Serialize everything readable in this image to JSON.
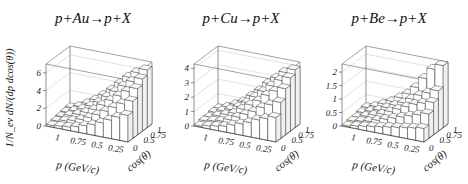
{
  "figure": {
    "y_axis_label": "1/N_ev dN/(dp dcos(θ))"
  },
  "panels": [
    {
      "title": "p+Au→p+X",
      "zticks": [
        "0",
        "2",
        "4",
        "6"
      ],
      "zmax": 7,
      "pticks": [
        "1",
        "0.75",
        "0.5",
        "0.25"
      ],
      "cticks": [
        "0",
        "0.5",
        "0.75",
        "1"
      ],
      "xlabel": "p (GeV/c)",
      "clabel": "cos(θ)"
    },
    {
      "title": "p+Cu→p+X",
      "zticks": [
        "0",
        "1",
        "2",
        "3",
        "4"
      ],
      "zmax": 4.3,
      "pticks": [
        "1",
        "0.75",
        "0.5",
        "0.25"
      ],
      "cticks": [
        "0",
        "0.5",
        "0.75",
        "1"
      ],
      "xlabel": "p (GeV/c)",
      "clabel": "cos(θ)"
    },
    {
      "title": "p+Be→p+X",
      "zticks": [
        "0",
        "0.5",
        "1",
        "1.5",
        "2"
      ],
      "zmax": 2.3,
      "pticks": [
        "1",
        "0.75",
        "0.5",
        "0.25"
      ],
      "cticks": [
        "0",
        "0.5",
        "0.75",
        "1"
      ],
      "xlabel": "p (GeV/c)",
      "clabel": "cos(θ)"
    }
  ],
  "chart_data": [
    {
      "type": "heatmap",
      "title": "p+Au→p+X",
      "xlabel": "p (GeV/c)",
      "ylabel": "cos(θ)",
      "zlabel": "1/N_ev dN/(dp dcos(θ))",
      "x_ticks": [
        1,
        0.75,
        0.5,
        0.25
      ],
      "y_ticks": [
        0,
        0.5,
        0.75,
        1
      ],
      "z_ticks": [
        0,
        2,
        4,
        6
      ],
      "zlim": [
        0,
        7
      ],
      "note": "3D lego histogram; heights grow toward low p and high cos(θ), max ≈ 6.5",
      "p_bins": [
        1.1,
        1.0,
        0.9,
        0.8,
        0.7,
        0.6,
        0.5,
        0.4,
        0.3,
        0.2
      ],
      "cos_bins": [
        0.1,
        0.3,
        0.5,
        0.7,
        0.9
      ],
      "values": [
        [
          0.2,
          0.3,
          0.4,
          0.6,
          0.9,
          1.2,
          1.6,
          2.1,
          2.6,
          3.0
        ],
        [
          0.3,
          0.5,
          0.7,
          1.0,
          1.4,
          1.9,
          2.5,
          3.1,
          3.7,
          4.2
        ],
        [
          0.4,
          0.7,
          1.0,
          1.4,
          1.9,
          2.6,
          3.3,
          4.0,
          4.7,
          5.2
        ],
        [
          0.5,
          0.8,
          1.2,
          1.7,
          2.3,
          3.1,
          3.9,
          4.7,
          5.4,
          5.9
        ],
        [
          0.6,
          0.9,
          1.4,
          2.0,
          2.7,
          3.5,
          4.4,
          5.3,
          6.0,
          6.5
        ]
      ]
    },
    {
      "type": "heatmap",
      "title": "p+Cu→p+X",
      "xlabel": "p (GeV/c)",
      "ylabel": "cos(θ)",
      "zlabel": "1/N_ev dN/(dp dcos(θ))",
      "x_ticks": [
        1,
        0.75,
        0.5,
        0.25
      ],
      "y_ticks": [
        0,
        0.5,
        0.75,
        1
      ],
      "z_ticks": [
        0,
        1,
        2,
        3,
        4
      ],
      "zlim": [
        0,
        4.3
      ],
      "note": "3D lego histogram; max ≈ 4",
      "p_bins": [
        1.1,
        1.0,
        0.9,
        0.8,
        0.7,
        0.6,
        0.5,
        0.4,
        0.3,
        0.2
      ],
      "cos_bins": [
        0.1,
        0.3,
        0.5,
        0.7,
        0.9
      ],
      "values": [
        [
          0.1,
          0.2,
          0.3,
          0.4,
          0.6,
          0.8,
          1.0,
          1.3,
          1.5,
          1.7
        ],
        [
          0.2,
          0.3,
          0.4,
          0.6,
          0.9,
          1.2,
          1.5,
          1.9,
          2.2,
          2.5
        ],
        [
          0.2,
          0.4,
          0.6,
          0.8,
          1.2,
          1.6,
          2.0,
          2.5,
          2.9,
          3.2
        ],
        [
          0.3,
          0.5,
          0.7,
          1.0,
          1.4,
          1.9,
          2.4,
          2.9,
          3.4,
          3.7
        ],
        [
          0.3,
          0.5,
          0.8,
          1.1,
          1.6,
          2.1,
          2.7,
          3.2,
          3.7,
          4.0
        ]
      ]
    },
    {
      "type": "heatmap",
      "title": "p+Be→p+X",
      "xlabel": "p (GeV/c)",
      "ylabel": "cos(θ)",
      "zlabel": "1/N_ev dN/(dp dcos(θ))",
      "x_ticks": [
        1,
        0.75,
        0.5,
        0.25
      ],
      "y_ticks": [
        0,
        0.5,
        0.75,
        1
      ],
      "z_ticks": [
        0,
        0.5,
        1,
        1.5,
        2
      ],
      "zlim": [
        0,
        2.3
      ],
      "note": "3D lego histogram; sharp forward peak at cos(θ)≈1, low p, max ≈ 2.3",
      "p_bins": [
        1.1,
        1.0,
        0.9,
        0.8,
        0.7,
        0.6,
        0.5,
        0.4,
        0.3,
        0.2
      ],
      "cos_bins": [
        0.1,
        0.3,
        0.5,
        0.7,
        0.9
      ],
      "values": [
        [
          0.05,
          0.1,
          0.15,
          0.2,
          0.25,
          0.3,
          0.35,
          0.4,
          0.45,
          0.5
        ],
        [
          0.1,
          0.15,
          0.2,
          0.3,
          0.4,
          0.5,
          0.6,
          0.7,
          0.8,
          0.9
        ],
        [
          0.1,
          0.2,
          0.3,
          0.4,
          0.55,
          0.7,
          0.85,
          1.0,
          1.1,
          1.2
        ],
        [
          0.15,
          0.25,
          0.35,
          0.5,
          0.65,
          0.8,
          1.0,
          1.2,
          1.35,
          1.5
        ],
        [
          0.2,
          0.3,
          0.45,
          0.6,
          0.8,
          1.0,
          1.3,
          1.7,
          2.1,
          2.3
        ]
      ]
    }
  ]
}
